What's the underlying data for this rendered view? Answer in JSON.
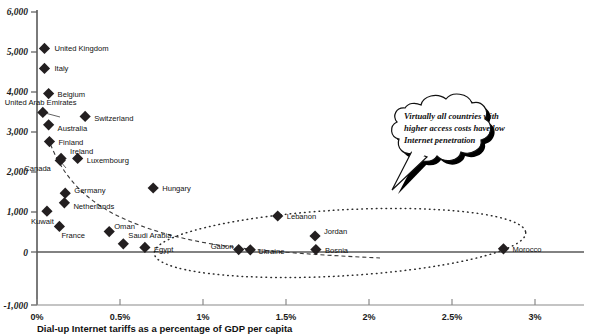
{
  "chart_data": {
    "type": "scatter",
    "title": "",
    "xlabel": "Dial-up Internet tariffs as a percentage of GDP per capita",
    "ylabel": "",
    "xlim": [
      0,
      3.25
    ],
    "ylim": [
      -1000,
      6000
    ],
    "grid": false,
    "legend": "none",
    "xtick_labels": [
      "0%",
      "0.5%",
      "1%",
      "1.5%",
      "2%",
      "2.5%",
      "3%"
    ],
    "xtick_values": [
      0,
      0.5,
      1,
      1.5,
      2,
      2.5,
      3
    ],
    "ytick_labels": [
      "6,000",
      "5,000",
      "4,000",
      "3,000",
      "2,000",
      "1,000",
      "0",
      "-1,000"
    ],
    "ytick_values": [
      6000,
      5000,
      4000,
      3000,
      2000,
      1000,
      0,
      -1000
    ],
    "points": [
      {
        "label": "United Kingdom",
        "x": 0.045,
        "y": 5090,
        "lx": 10,
        "ly": 3
      },
      {
        "label": "Italy",
        "x": 0.045,
        "y": 4590,
        "lx": 10,
        "ly": 3
      },
      {
        "label": "Belgium",
        "x": 0.07,
        "y": 3960,
        "lx": 9,
        "ly": 3
      },
      {
        "label": "United Arab Emirates",
        "x": 0.035,
        "y": 3490,
        "lx": -38,
        "ly": -7
      },
      {
        "label": "Switzerland",
        "x": 0.29,
        "y": 3390,
        "lx": 9,
        "ly": 5
      },
      {
        "label": "Australia",
        "x": 0.07,
        "y": 3180,
        "lx": 9,
        "ly": 6
      },
      {
        "label": "Finland",
        "x": 0.075,
        "y": 2760,
        "lx": 9,
        "ly": 3
      },
      {
        "label": "Ireland",
        "x": 0.145,
        "y": 2340,
        "lx": 9,
        "ly": -4
      },
      {
        "label": "Luxembourg",
        "x": 0.245,
        "y": 2340,
        "lx": 9,
        "ly": 5
      },
      {
        "label": "Canada",
        "x": 0.14,
        "y": 2290,
        "lx": -36,
        "ly": 11
      },
      {
        "label": "Hungary",
        "x": 0.7,
        "y": 1600,
        "lx": 9,
        "ly": 3
      },
      {
        "label": "Germany",
        "x": 0.17,
        "y": 1470,
        "lx": 9,
        "ly": 0
      },
      {
        "label": "Netherlands",
        "x": 0.165,
        "y": 1230,
        "lx": 9,
        "ly": 6
      },
      {
        "label": "Kuwait",
        "x": 0.06,
        "y": 1020,
        "lx": -16,
        "ly": 13
      },
      {
        "label": "France",
        "x": 0.135,
        "y": 640,
        "lx": 2,
        "ly": 12
      },
      {
        "label": "Oman",
        "x": 0.435,
        "y": 510,
        "lx": 5,
        "ly": -3
      },
      {
        "label": "Saudi Arabia",
        "x": 0.52,
        "y": 205,
        "lx": 5,
        "ly": -6
      },
      {
        "label": "Egypt",
        "x": 0.65,
        "y": 115,
        "lx": 9,
        "ly": 5
      },
      {
        "label": "Gabon",
        "x": 1.215,
        "y": 60,
        "lx": -28,
        "ly": -1
      },
      {
        "label": "Ukraine",
        "x": 1.285,
        "y": 55,
        "lx": 8,
        "ly": 4
      },
      {
        "label": "Lebanon",
        "x": 1.45,
        "y": 900,
        "lx": 9,
        "ly": 3
      },
      {
        "label": "Jordan",
        "x": 1.675,
        "y": 400,
        "lx": 9,
        "ly": -2
      },
      {
        "label": "Bosnia",
        "x": 1.68,
        "y": 60,
        "lx": 9,
        "ly": 3
      },
      {
        "label": "Morocco",
        "x": 2.81,
        "y": 80,
        "lx": 9,
        "ly": 3
      }
    ],
    "trendline": {
      "style": "dashed",
      "description": "downward-sloping dashed power-law fit"
    },
    "annotations": [
      {
        "type": "callout",
        "shape": "cloud",
        "lines": [
          "Virtually all countries with",
          "higher access costs have low",
          "Internet penetration"
        ]
      },
      {
        "type": "ellipse",
        "style": "dotted",
        "description": "dotted ellipse encircling the low-penetration high-cost countries"
      }
    ]
  },
  "colors": {
    "marker": "#231f20",
    "axis": "#595959",
    "text": "#111111",
    "background": "#ffffff"
  }
}
